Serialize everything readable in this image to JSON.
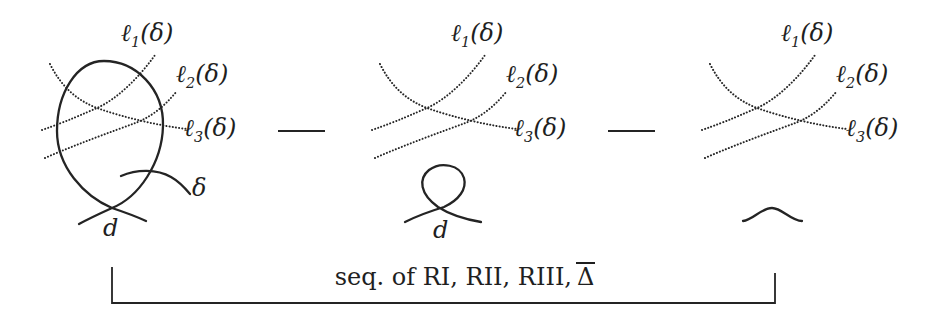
{
  "colors": {
    "ink": "#222222",
    "background": "#ffffff"
  },
  "labels": {
    "lines": [
      {
        "base": "ℓ",
        "sub": "1",
        "suffix": "(δ)"
      },
      {
        "base": "ℓ",
        "sub": "2",
        "suffix": "(δ)"
      },
      {
        "base": "ℓ",
        "sub": "3",
        "suffix": "(δ)"
      }
    ],
    "delta": "δ",
    "d": "d"
  },
  "caption": {
    "text": "seq. of RI, RII, RIII,",
    "delta_overline": "Δ"
  }
}
